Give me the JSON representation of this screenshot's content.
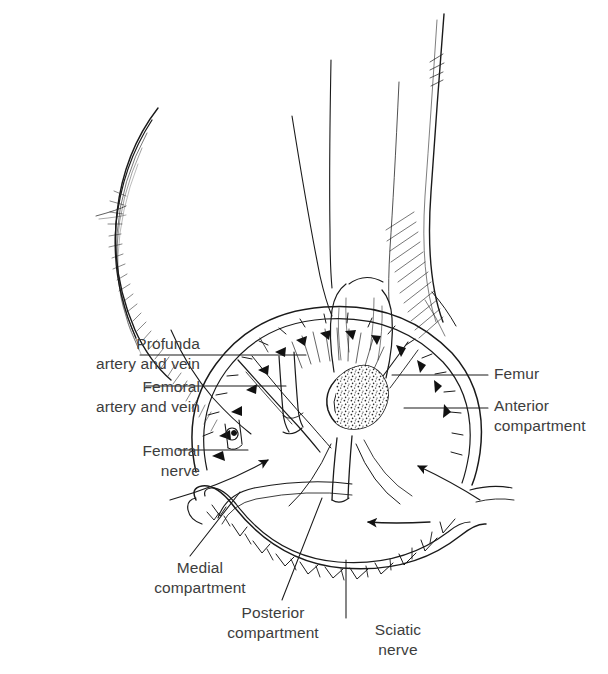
{
  "figure": {
    "kind": "anatomical-line-drawing",
    "view": "Anterior-inferior oblique view of right thigh with transverse section",
    "ink_color": "#1a1a1a",
    "label_color": "#3d3d3d",
    "background_color": "#ffffff"
  },
  "labels": [
    {
      "id": "profunda",
      "text": "Profunda\nartery and vein",
      "align": "right",
      "x": 14,
      "y": 334,
      "w": 186,
      "leader": "horizontal-right"
    },
    {
      "id": "femoral-vessels",
      "text": "Femoral\nartery and vein",
      "align": "right",
      "x": 14,
      "y": 377,
      "w": 186,
      "leader": "horizontal-right"
    },
    {
      "id": "femoral-nerve",
      "text": "Femoral\nnerve",
      "align": "right",
      "x": 14,
      "y": 441,
      "w": 186,
      "leader": "horizontal-right"
    },
    {
      "id": "femur",
      "text": "Femur",
      "align": "left",
      "x": 494,
      "y": 364,
      "w": 110,
      "leader": "horizontal-left"
    },
    {
      "id": "anterior-compartment",
      "text": "Anterior\ncompartment",
      "align": "left",
      "x": 494,
      "y": 396,
      "w": 112,
      "leader": "horizontal-left"
    },
    {
      "id": "medial-compartment",
      "text": "Medial\ncompartment",
      "align": "center",
      "x": 130,
      "y": 558,
      "w": 140,
      "leader": "diagonal-up-right"
    },
    {
      "id": "posterior-compartment",
      "text": "Posterior\ncompartment",
      "align": "center",
      "x": 198,
      "y": 603,
      "w": 150,
      "leader": "diagonal-up-right"
    },
    {
      "id": "sciatic-nerve",
      "text": "Sciatic\nnerve",
      "align": "center",
      "x": 348,
      "y": 620,
      "w": 100,
      "leader": "vertical-up"
    }
  ],
  "structures": [
    {
      "id": "femur-bone",
      "name": "Femur (cut shaft with trabecular marrow)"
    },
    {
      "id": "anterior-band",
      "name": "Anterior compartment fascial band"
    },
    {
      "id": "medial-band",
      "name": "Medial compartment fascial band"
    },
    {
      "id": "posterior-band",
      "name": "Posterior compartment fascial band"
    },
    {
      "id": "profunda-vessels",
      "name": "Profunda femoris artery and vein"
    },
    {
      "id": "femoral-vessels-structure",
      "name": "Femoral artery and vein"
    },
    {
      "id": "femoral-nerve-structure",
      "name": "Femoral nerve"
    },
    {
      "id": "sciatic-nerve-structure",
      "name": "Sciatic nerve"
    },
    {
      "id": "thigh-outline-left",
      "name": "Left thigh skin contour with hatching"
    },
    {
      "id": "thigh-outline-right",
      "name": "Right thigh skin contour with hatching"
    },
    {
      "id": "arrow-medial",
      "name": "Pointer arrow into medial compartment"
    },
    {
      "id": "arrow-anterior",
      "name": "Pointer arrow into anterior compartment"
    },
    {
      "id": "arrow-posterior",
      "name": "Pointer arrow into posterior compartment"
    }
  ]
}
